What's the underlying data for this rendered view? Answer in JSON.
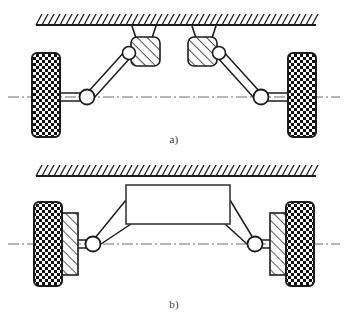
{
  "figure": {
    "type": "technical-line-diagram",
    "panels": [
      {
        "id": "a",
        "caption": "a)",
        "description": "Double wishbone / trailing arm suspension with two hatched pivot blocks mounted to the hatched chassis datum line",
        "ground_line": {
          "name": "hatched-chassis-line",
          "x_start": 36,
          "x_end": 316,
          "y": 25,
          "hatch_count": 47,
          "hatch_direction": "up-right"
        },
        "wheels": [
          {
            "side": "left",
            "x": 32,
            "y": 53,
            "width": 28,
            "height": 84,
            "pattern": "checkerboard"
          },
          {
            "side": "right",
            "x": 288,
            "y": 53,
            "width": 28,
            "height": 84,
            "pattern": "checkerboard"
          }
        ],
        "mount_blocks": [
          {
            "side": "left",
            "x": 131,
            "y": 37,
            "width": 29,
            "height": 29,
            "pattern": "diagonal-hatch",
            "pivot_side": "left"
          },
          {
            "side": "right",
            "x": 188,
            "y": 37,
            "width": 29,
            "height": 29,
            "pattern": "diagonal-hatch",
            "pivot_side": "right"
          }
        ],
        "hubs": [
          {
            "side": "left",
            "cx": 87,
            "cy": 97,
            "r": 7
          },
          {
            "side": "right",
            "cx": 261,
            "cy": 97,
            "r": 7
          }
        ],
        "centerline": {
          "y": 97,
          "x_start": 8,
          "x_end": 340,
          "style": "dash-dot"
        }
      },
      {
        "id": "b",
        "caption": "b)",
        "description": "Rigid-body axle suspension: central box body linked by angled arms to hatched strut plates on each wheel",
        "ground_line": {
          "name": "hatched-chassis-line",
          "x_start": 36,
          "x_end": 316,
          "y": 176,
          "hatch_count": 47,
          "hatch_direction": "up-right"
        },
        "wheels": [
          {
            "side": "left",
            "x": 34,
            "y": 202,
            "width": 28,
            "height": 84,
            "pattern": "checkerboard"
          },
          {
            "side": "right",
            "x": 286,
            "y": 202,
            "width": 28,
            "height": 84,
            "pattern": "checkerboard"
          }
        ],
        "strut_plates": [
          {
            "side": "left",
            "x": 62,
            "y": 213,
            "width": 16,
            "height": 62,
            "pattern": "diagonal-hatch"
          },
          {
            "side": "right",
            "x": 270,
            "y": 213,
            "width": 16,
            "height": 62,
            "pattern": "diagonal-hatch"
          }
        ],
        "body_box": {
          "x": 126,
          "y": 185,
          "width": 104,
          "height": 39,
          "fill": "none"
        },
        "hubs": [
          {
            "side": "left",
            "cx": 93,
            "cy": 244,
            "r": 7
          },
          {
            "side": "right",
            "cx": 255,
            "cy": 244,
            "r": 7
          }
        ],
        "centerline": {
          "y": 244,
          "x_start": 8,
          "x_end": 340,
          "style": "dash-dot"
        }
      }
    ]
  },
  "colors": {
    "stroke": "#1c1c1c",
    "stroke_soft": "#2b2b2b",
    "background": "#ffffff",
    "checker_dark": "#101010",
    "caption": "#3a3a3a"
  }
}
